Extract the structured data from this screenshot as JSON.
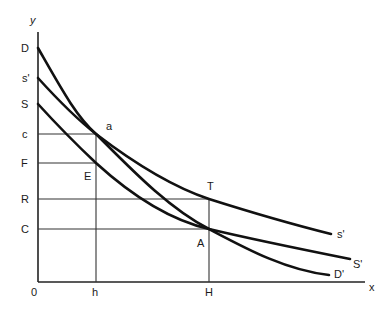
{
  "diagram": {
    "axes": {
      "x_label": "x",
      "y_label": "y",
      "origin_label": "0"
    },
    "y_axis_labels": {
      "D": "D",
      "s_prime": "s'",
      "S": "S",
      "c": "c",
      "F": "F",
      "R": "R",
      "C": "C"
    },
    "x_axis_labels": {
      "h": "h",
      "H": "H"
    },
    "point_labels": {
      "a": "a",
      "E": "E",
      "T": "T",
      "A": "A"
    },
    "curve_end_labels": {
      "s_prime": "s'",
      "S_prime": "S'",
      "D_prime": "D'"
    },
    "curves": [
      {
        "name": "D-D'",
        "start": "D",
        "end": "D'",
        "passes_through": [
          "a",
          "A"
        ]
      },
      {
        "name": "s'-s'",
        "start": "s'",
        "end": "s'",
        "passes_through": [
          "a",
          "T"
        ]
      },
      {
        "name": "S-S'",
        "start": "S",
        "end": "S'",
        "passes_through": [
          "E",
          "A"
        ]
      }
    ],
    "guide_lines": [
      {
        "from": "c",
        "to": "a",
        "type": "horizontal"
      },
      {
        "from": "F",
        "to": "E",
        "type": "horizontal"
      },
      {
        "from": "R",
        "to": "T",
        "type": "horizontal"
      },
      {
        "from": "C",
        "to": "A",
        "type": "horizontal"
      },
      {
        "from": "h",
        "to": "a",
        "type": "vertical"
      },
      {
        "from": "H",
        "to": "T",
        "type": "vertical"
      }
    ]
  }
}
